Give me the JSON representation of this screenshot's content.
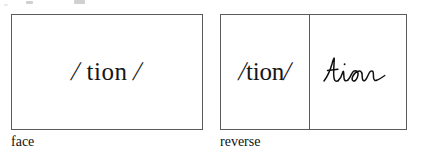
{
  "figure": {
    "background_color": "#ffffff",
    "border_color": "#5b5b5f",
    "ink_color": "#161616"
  },
  "cards": {
    "face": {
      "caption": "face",
      "prompt_text": "/ tion /",
      "prompt_open_slash": "/",
      "prompt_body": " tion ",
      "prompt_close_slash": "/"
    },
    "reverse": {
      "caption": "reverse",
      "prompt_text": "/tion/",
      "prompt_open_slash": "/",
      "prompt_body": "tion",
      "prompt_close_slash": "/",
      "answer_text": "tion",
      "answer_style": "handwritten-cursive"
    }
  }
}
